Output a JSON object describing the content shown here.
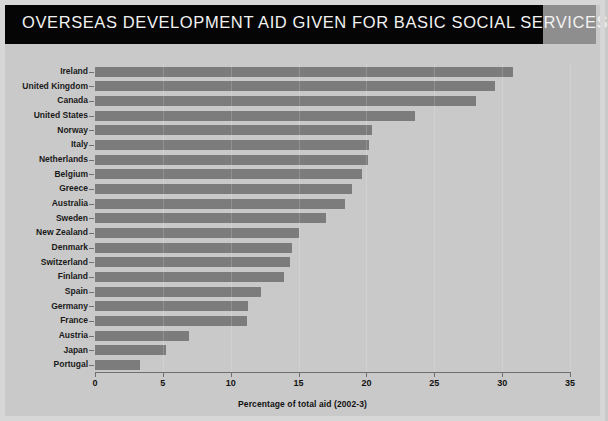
{
  "title": "OVERSEAS DEVELOPMENT AID GIVEN FOR BASIC SOCIAL SERVICES",
  "colors": {
    "title_band": "#050505",
    "title_accent": "#8e8e8e",
    "title_text": "#f2f2f2",
    "background": "#c9c9c9",
    "bar": "#7c7c7c",
    "axis": "#6f6f6f",
    "text": "#111111"
  },
  "chart_data": {
    "type": "bar",
    "orientation": "horizontal",
    "title": "OVERSEAS DEVELOPMENT AID GIVEN FOR BASIC SOCIAL SERVICES",
    "xlabel": "Percentage of total aid (2002-3)",
    "ylabel": "",
    "xlim": [
      0,
      35
    ],
    "xticks": [
      0,
      5,
      10,
      15,
      20,
      25,
      30,
      35
    ],
    "grid": false,
    "legend": null,
    "categories": [
      "Ireland",
      "United Kingdom",
      "Canada",
      "United States",
      "Norway",
      "Italy",
      "Netherlands",
      "Belgium",
      "Greece",
      "Australia",
      "Sweden",
      "New Zealand",
      "Denmark",
      "Switzerland",
      "Finland",
      "Spain",
      "Germany",
      "France",
      "Austria",
      "Japan",
      "Portugal"
    ],
    "values": [
      30.8,
      29.5,
      28.1,
      23.6,
      20.4,
      20.2,
      20.1,
      19.7,
      18.9,
      18.4,
      17.0,
      15.0,
      14.5,
      14.4,
      13.9,
      12.2,
      11.3,
      11.2,
      6.9,
      5.2,
      3.3
    ]
  }
}
